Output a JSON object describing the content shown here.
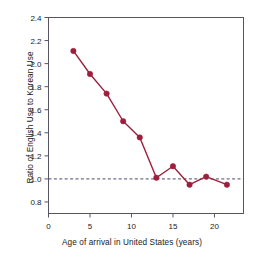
{
  "chart_data": {
    "type": "line",
    "title": "",
    "xlabel": "Age of arrival in United States (years)",
    "ylabel": "Ratio of English Use to Korean Use",
    "xlim": [
      0,
      23.5
    ],
    "ylim": [
      0.7,
      2.4
    ],
    "xticks": [
      0,
      5,
      10,
      15,
      20
    ],
    "xtick_labels": [
      "0",
      "5",
      "10",
      "15",
      "20"
    ],
    "yticks": [
      0.8,
      1.0,
      1.2,
      1.4,
      1.6,
      1.8,
      2.0,
      2.2,
      2.4
    ],
    "ytick_labels": [
      "0.8",
      "1.0",
      "1.2",
      "1.4",
      "1.6",
      "1.8",
      "2.0",
      "2.2",
      "2.4"
    ],
    "grid": false,
    "legend": false,
    "series": [
      {
        "name": "Ratio of English Use to Korean Use",
        "color": "#9e1f3c",
        "marker": "circle",
        "x": [
          3,
          5,
          7,
          9,
          11,
          13,
          15,
          17,
          19,
          21.5
        ],
        "values": [
          2.11,
          1.91,
          1.74,
          1.5,
          1.36,
          1.01,
          1.11,
          0.95,
          1.02,
          0.95
        ]
      }
    ],
    "reference_lines": [
      {
        "name": "parity-line",
        "orientation": "horizontal",
        "value": 1.0,
        "style": "dashed",
        "color": "#4a4a66"
      }
    ]
  },
  "colors": {
    "series": "#9e1f3c",
    "axis": "#555566",
    "reference": "#4a4a66",
    "text": "#1a1a1a",
    "background": "#ffffff"
  }
}
